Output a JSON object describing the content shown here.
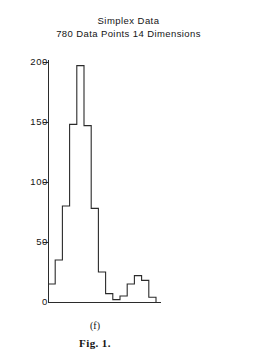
{
  "figure": {
    "title": "Simplex Data",
    "subtitle": "780 Data Points  14 Dimensions",
    "panel_label": "(f)",
    "caption": "Fig. 1."
  },
  "axis": {
    "y_ticks": [
      "200",
      "150",
      "100",
      "50",
      "0"
    ],
    "y_tick_values": [
      200,
      150,
      100,
      50,
      0
    ]
  },
  "chart_data": {
    "type": "bar",
    "title": "Simplex Data",
    "subtitle": "780 Data Points  14 Dimensions",
    "xlabel": "",
    "ylabel": "",
    "ylim": [
      0,
      205
    ],
    "grid": false,
    "legend": "none",
    "note": "histogram outline (step plot), 15 equal-width bins",
    "categories": [
      "1",
      "2",
      "3",
      "4",
      "5",
      "6",
      "7",
      "8",
      "9",
      "10",
      "11",
      "12",
      "13",
      "14",
      "15"
    ],
    "values": [
      15,
      35,
      80,
      148,
      197,
      147,
      78,
      25,
      7,
      2,
      5,
      15,
      22,
      18,
      4
    ],
    "bin_width_px": 7.2,
    "axis_ticks": [
      0,
      50,
      100,
      150,
      200
    ]
  },
  "colors": {
    "ink": "#2b2b2b",
    "text": "#141414",
    "background": "#ffffff"
  }
}
